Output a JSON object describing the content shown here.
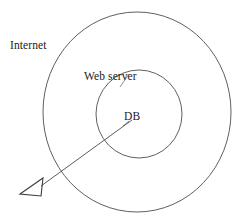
{
  "diagram": {
    "type": "concentric-zone-diagram",
    "background_color": "#ffffff",
    "stroke_color": "#4d4d4d",
    "text_color": "#1a1a1a",
    "zones": [
      {
        "id": "internet",
        "label": "Internet",
        "shape": "circle",
        "center_x": 137,
        "center_y": 112,
        "radius_x": 94,
        "radius_y": 100,
        "label_x": 10,
        "label_y": 40
      },
      {
        "id": "web-server",
        "label": "Web server",
        "shape": "circle",
        "center_x": 139,
        "center_y": 114,
        "radius_x": 43,
        "radius_y": 44,
        "label_x": 84,
        "label_y": 71
      },
      {
        "id": "db",
        "label": "DB",
        "shape": "point",
        "center_x": 132,
        "center_y": 116,
        "label_x": 124,
        "label_y": 111
      }
    ],
    "attack_path": {
      "id": "attack-arrow",
      "from_x": 132,
      "from_y": 120,
      "to_x": 38,
      "to_y": 188,
      "arrow_style": "open-triangle",
      "arrow_filled": false
    },
    "leader_lines": [
      {
        "id": "web-server-leader",
        "x1": 128,
        "y1": 72,
        "x2": 119,
        "y2": 86
      },
      {
        "id": "db-leader",
        "x1": 129,
        "y1": 120,
        "x2": 122,
        "y2": 126
      }
    ]
  }
}
